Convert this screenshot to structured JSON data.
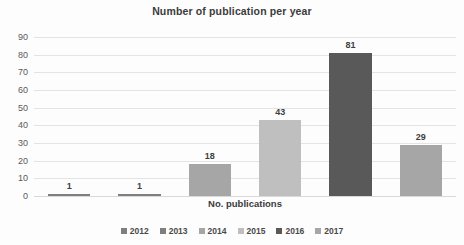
{
  "chart_data": {
    "type": "bar",
    "title": "Number of publication per year",
    "xlabel": "No. publications",
    "ylabel": "",
    "categories": [
      "2012",
      "2013",
      "2014",
      "2015",
      "2016",
      "2017"
    ],
    "values": [
      1,
      1,
      18,
      43,
      81,
      29
    ],
    "data_labels": [
      "1",
      "1",
      "18",
      "43",
      "81",
      "29"
    ],
    "ylim": [
      0,
      90
    ],
    "yticks": [
      90,
      80,
      70,
      60,
      50,
      40,
      30,
      20,
      10,
      0
    ],
    "ytick_labels": [
      "90",
      "80",
      "70",
      "60",
      "50",
      "40",
      "30",
      "20",
      "10",
      "0"
    ],
    "grid": true,
    "legend_position": "bottom",
    "series_colors": [
      "#7f7f7f",
      "#7f7f7f",
      "#a6a6a6",
      "#bfbfbf",
      "#595959",
      "#a6a6a6"
    ],
    "legend": [
      {
        "label": "2012",
        "color": "#7f7f7f"
      },
      {
        "label": "2013",
        "color": "#7f7f7f"
      },
      {
        "label": "2014",
        "color": "#a6a6a6"
      },
      {
        "label": "2015",
        "color": "#bfbfbf"
      },
      {
        "label": "2016",
        "color": "#595959"
      },
      {
        "label": "2017",
        "color": "#a6a6a6"
      }
    ]
  }
}
